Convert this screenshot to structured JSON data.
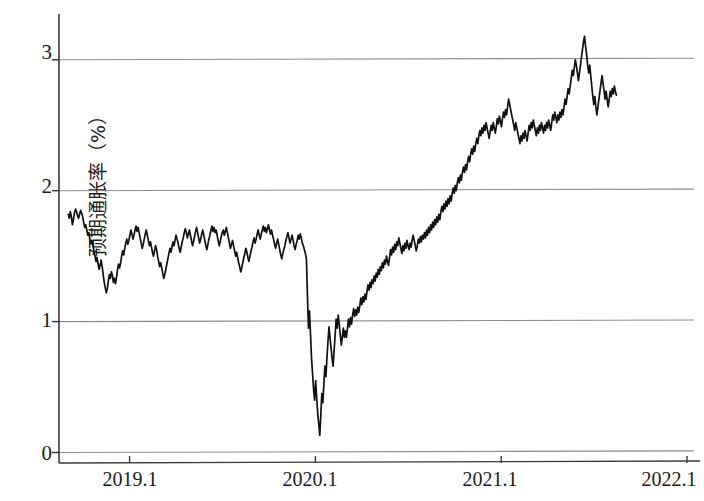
{
  "chart_data": {
    "type": "line",
    "title": "",
    "subtitle": "",
    "xlabel": "",
    "ylabel": "预期通胀率（%）",
    "ylabel_parts": {
      "text": "预期通胀率",
      "unit": "（%）"
    },
    "xlim": [
      2018.62,
      2022.07
    ],
    "ylim": [
      -0.08,
      3.35
    ],
    "yticks": [
      0,
      1,
      2,
      3
    ],
    "ytick_labels": [
      "0",
      "1",
      "2",
      "3"
    ],
    "xticks": [
      2019.0,
      2020.0,
      2021.0,
      2022.0
    ],
    "xtick_labels": [
      "2019.1",
      "2020.1",
      "2021.1",
      "2022.1"
    ],
    "grid": "horizontal-only",
    "gridlines_at": [
      0,
      1,
      2,
      3
    ],
    "legend": "none",
    "line_color": "#111111",
    "grid_color": "#8c8c8c",
    "axis_color": "#444444",
    "background_color": "#ffffff",
    "series": [
      {
        "name": "预期通胀率",
        "units": "%",
        "x_start": 2018.67,
        "x_end": 2021.62,
        "annotations": {
          "start_value": 1.82,
          "pre_covid_local_high": 1.86,
          "late_2018_trough": 1.22,
          "covid_crash_min": 0.13,
          "covid_crash_date": "2020.22",
          "peak_value": 3.18,
          "peak_date": "2021.45",
          "end_value": 2.73
        },
        "values": [
          1.82,
          1.79,
          1.84,
          1.8,
          1.74,
          1.78,
          1.83,
          1.86,
          1.84,
          1.81,
          1.79,
          1.82,
          1.85,
          1.83,
          1.8,
          1.76,
          1.72,
          1.74,
          1.7,
          1.66,
          1.68,
          1.63,
          1.6,
          1.62,
          1.58,
          1.54,
          1.5,
          1.46,
          1.49,
          1.44,
          1.4,
          1.43,
          1.47,
          1.42,
          1.36,
          1.3,
          1.26,
          1.22,
          1.25,
          1.31,
          1.36,
          1.33,
          1.38,
          1.35,
          1.3,
          1.33,
          1.29,
          1.34,
          1.4,
          1.44,
          1.41,
          1.45,
          1.5,
          1.54,
          1.51,
          1.56,
          1.6,
          1.63,
          1.59,
          1.62,
          1.66,
          1.7,
          1.67,
          1.63,
          1.66,
          1.7,
          1.73,
          1.69,
          1.72,
          1.68,
          1.64,
          1.6,
          1.56,
          1.59,
          1.63,
          1.67,
          1.7,
          1.66,
          1.62,
          1.58,
          1.61,
          1.57,
          1.53,
          1.5,
          1.54,
          1.58,
          1.55,
          1.5,
          1.46,
          1.42,
          1.45,
          1.41,
          1.37,
          1.33,
          1.36,
          1.4,
          1.44,
          1.48,
          1.52,
          1.56,
          1.53,
          1.57,
          1.61,
          1.58,
          1.62,
          1.66,
          1.63,
          1.6,
          1.56,
          1.53,
          1.57,
          1.61,
          1.64,
          1.68,
          1.71,
          1.68,
          1.64,
          1.67,
          1.7,
          1.66,
          1.62,
          1.58,
          1.61,
          1.65,
          1.69,
          1.72,
          1.68,
          1.64,
          1.6,
          1.63,
          1.67,
          1.7,
          1.66,
          1.62,
          1.58,
          1.55,
          1.59,
          1.63,
          1.66,
          1.7,
          1.73,
          1.69,
          1.72,
          1.68,
          1.7,
          1.66,
          1.62,
          1.58,
          1.61,
          1.65,
          1.68,
          1.7,
          1.66,
          1.69,
          1.72,
          1.68,
          1.64,
          1.6,
          1.56,
          1.59,
          1.62,
          1.58,
          1.54,
          1.5,
          1.53,
          1.49,
          1.45,
          1.42,
          1.38,
          1.41,
          1.45,
          1.49,
          1.52,
          1.56,
          1.53,
          1.49,
          1.46,
          1.5,
          1.54,
          1.57,
          1.61,
          1.64,
          1.6,
          1.63,
          1.67,
          1.7,
          1.66,
          1.63,
          1.67,
          1.7,
          1.73,
          1.69,
          1.72,
          1.68,
          1.71,
          1.74,
          1.7,
          1.67,
          1.7,
          1.66,
          1.63,
          1.59,
          1.56,
          1.6,
          1.63,
          1.59,
          1.55,
          1.51,
          1.48,
          1.52,
          1.55,
          1.58,
          1.62,
          1.65,
          1.68,
          1.64,
          1.6,
          1.63,
          1.66,
          1.62,
          1.58,
          1.55,
          1.59,
          1.62,
          1.66,
          1.63,
          1.67,
          1.64,
          1.6,
          1.58,
          1.55,
          1.52,
          1.48,
          1.2,
          0.95,
          1.08,
          0.9,
          0.72,
          0.6,
          0.48,
          0.4,
          0.55,
          0.42,
          0.3,
          0.22,
          0.13,
          0.28,
          0.45,
          0.38,
          0.52,
          0.66,
          0.58,
          0.72,
          0.85,
          0.96,
          0.88,
          0.8,
          0.72,
          0.66,
          0.78,
          0.9,
          1.02,
          0.95,
          1.05,
          0.98,
          0.9,
          0.82,
          0.88,
          0.95,
          0.88,
          0.93,
          0.88,
          0.95,
          1.02,
          0.96,
          1.03,
          0.98,
          1.05,
          1.1,
          1.04,
          1.09,
          1.05,
          1.11,
          1.07,
          1.12,
          1.18,
          1.13,
          1.19,
          1.15,
          1.21,
          1.17,
          1.23,
          1.28,
          1.24,
          1.3,
          1.26,
          1.32,
          1.29,
          1.35,
          1.31,
          1.37,
          1.34,
          1.4,
          1.36,
          1.42,
          1.39,
          1.45,
          1.41,
          1.47,
          1.44,
          1.5,
          1.46,
          1.43,
          1.49,
          1.55,
          1.51,
          1.57,
          1.53,
          1.59,
          1.55,
          1.61,
          1.58,
          1.64,
          1.6,
          1.56,
          1.52,
          1.58,
          1.54,
          1.6,
          1.56,
          1.62,
          1.58,
          1.55,
          1.6,
          1.57,
          1.62,
          1.66,
          1.62,
          1.58,
          1.54,
          1.58,
          1.63,
          1.6,
          1.65,
          1.61,
          1.66,
          1.63,
          1.68,
          1.64,
          1.7,
          1.66,
          1.72,
          1.68,
          1.74,
          1.7,
          1.76,
          1.72,
          1.78,
          1.74,
          1.8,
          1.76,
          1.82,
          1.78,
          1.84,
          1.88,
          1.84,
          1.9,
          1.86,
          1.92,
          1.88,
          1.94,
          1.9,
          1.96,
          1.92,
          1.98,
          2.02,
          1.98,
          2.04,
          2.0,
          2.06,
          2.1,
          2.06,
          2.12,
          2.08,
          2.14,
          2.18,
          2.14,
          2.2,
          2.16,
          2.22,
          2.26,
          2.22,
          2.28,
          2.32,
          2.28,
          2.34,
          2.3,
          2.36,
          2.4,
          2.36,
          2.42,
          2.46,
          2.42,
          2.48,
          2.44,
          2.5,
          2.46,
          2.52,
          2.48,
          2.44,
          2.4,
          2.45,
          2.5,
          2.46,
          2.52,
          2.48,
          2.44,
          2.49,
          2.55,
          2.51,
          2.57,
          2.53,
          2.49,
          2.55,
          2.6,
          2.56,
          2.62,
          2.58,
          2.64,
          2.7,
          2.66,
          2.62,
          2.58,
          2.54,
          2.5,
          2.46,
          2.52,
          2.48,
          2.44,
          2.4,
          2.36,
          2.42,
          2.38,
          2.44,
          2.4,
          2.46,
          2.42,
          2.38,
          2.44,
          2.5,
          2.46,
          2.52,
          2.48,
          2.54,
          2.5,
          2.46,
          2.42,
          2.48,
          2.44,
          2.5,
          2.46,
          2.52,
          2.48,
          2.44,
          2.5,
          2.46,
          2.52,
          2.48,
          2.54,
          2.5,
          2.46,
          2.52,
          2.58,
          2.54,
          2.6,
          2.56,
          2.52,
          2.58,
          2.54,
          2.6,
          2.56,
          2.62,
          2.58,
          2.64,
          2.7,
          2.66,
          2.72,
          2.78,
          2.74,
          2.8,
          2.86,
          2.92,
          2.88,
          2.94,
          3.0,
          2.96,
          2.9,
          2.84,
          2.9,
          2.96,
          3.02,
          3.08,
          3.14,
          3.18,
          3.1,
          3.04,
          2.96,
          2.9,
          2.96,
          2.88,
          2.8,
          2.72,
          2.66,
          2.72,
          2.64,
          2.58,
          2.64,
          2.7,
          2.76,
          2.82,
          2.88,
          2.82,
          2.76,
          2.7,
          2.76,
          2.7,
          2.64,
          2.7,
          2.76,
          2.72,
          2.78,
          2.74,
          2.8,
          2.76,
          2.73
        ]
      }
    ]
  },
  "axes": {
    "y_axis_name": "y-axis",
    "x_axis_name": "x-axis"
  }
}
